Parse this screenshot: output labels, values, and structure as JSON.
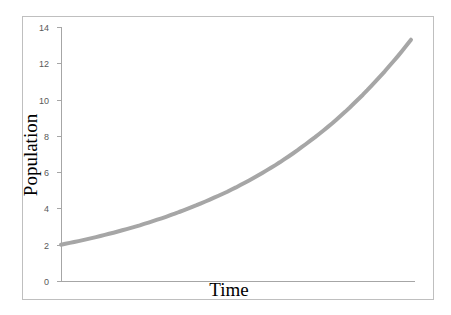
{
  "chart_data": {
    "type": "line",
    "title": "",
    "xlabel": "Time",
    "ylabel": "Population",
    "ylim": [
      0,
      14
    ],
    "yticks": [
      0,
      2,
      4,
      6,
      8,
      10,
      12,
      14
    ],
    "xticks": [],
    "grid": false,
    "legend": null,
    "series": [
      {
        "name": "Population",
        "color": "#a6a6a6",
        "x": [
          0,
          0.1,
          0.2,
          0.3,
          0.4,
          0.5,
          0.6,
          0.7,
          0.8,
          0.9,
          1.0
        ],
        "values": [
          2.0,
          2.42,
          2.93,
          3.54,
          4.28,
          5.16,
          6.24,
          7.55,
          9.12,
          11.03,
          13.3
        ]
      }
    ]
  },
  "colors": {
    "line": "#a6a6a6",
    "axis": "#a6a6a6",
    "frame": "#bfbfbf",
    "tick_text": "#595959"
  }
}
